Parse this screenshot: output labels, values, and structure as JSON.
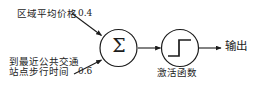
{
  "diagram": {
    "type": "perceptron",
    "stroke_color": "#1c1c1c",
    "background_color": "#ffffff",
    "inputs": [
      {
        "id": "input-1",
        "label": "区域平均价格",
        "weight": "0.4"
      },
      {
        "id": "input-2",
        "label_line1": "到最近公共交通",
        "label_line2": "站点步行时间",
        "weight": "0.6"
      }
    ],
    "summation": {
      "symbol": "Σ",
      "name": "summation-node"
    },
    "activation": {
      "label": "激活函数",
      "glyph": "step-function",
      "name": "activation-node"
    },
    "output": {
      "label": "输出"
    }
  }
}
